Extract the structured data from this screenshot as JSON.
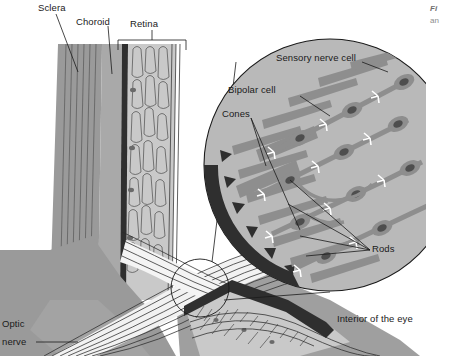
{
  "figure": {
    "type": "anatomical-diagram",
    "background_color": "#ffffff"
  },
  "palette": {
    "sclera": "#9a9a9a",
    "choroid": "#a9a9a9",
    "pigment_layer": "#2f2f2f",
    "retina": "#c9c9c9",
    "inset_fill": "#b9b9b9",
    "cell_gray": "#8e8e8e",
    "nucleus": "#5e5e5e",
    "line": "#1a1a1a",
    "white": "#ffffff"
  },
  "labels": {
    "sclera": "Sclera",
    "choroid": "Choroid",
    "retina": "Retina",
    "optic_nerve_line1": "Optic",
    "optic_nerve_line2": "nerve",
    "interior": "Interior of the eye"
  },
  "inset_labels": {
    "sensory_nerve_cell": "Sensory nerve cell",
    "bipolar_cell": "Bipolar cell",
    "cones": "Cones",
    "rods": "Rods"
  },
  "caption": {
    "line1": "Fi",
    "line2": "an"
  }
}
